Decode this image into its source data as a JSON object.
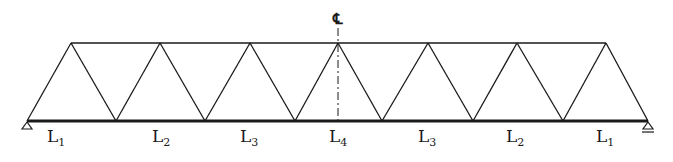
{
  "diagram": {
    "type": "warren-truss",
    "centerline_label": "℄",
    "chord_color": "#1a1a1a",
    "bottom_chord_nodes_x": [
      27,
      116,
      205,
      295,
      382,
      473,
      563,
      648
    ],
    "top_chord_nodes_x": [
      71,
      160,
      250,
      338,
      428,
      517,
      606
    ],
    "top_chord_y": 43,
    "bottom_chord_y": 121,
    "centerline_x": 338,
    "panel_labels": [
      {
        "base": "L",
        "sub": "1",
        "x": 47
      },
      {
        "base": "L",
        "sub": "2",
        "x": 152
      },
      {
        "base": "L",
        "sub": "3",
        "x": 240
      },
      {
        "base": "L",
        "sub": "4",
        "x": 329
      },
      {
        "base": "L",
        "sub": "3",
        "x": 418
      },
      {
        "base": "L",
        "sub": "2",
        "x": 506
      },
      {
        "base": "L",
        "sub": "1",
        "x": 596
      }
    ],
    "supports": [
      {
        "type": "pin",
        "x": 27
      },
      {
        "type": "roller",
        "x": 648
      }
    ]
  }
}
